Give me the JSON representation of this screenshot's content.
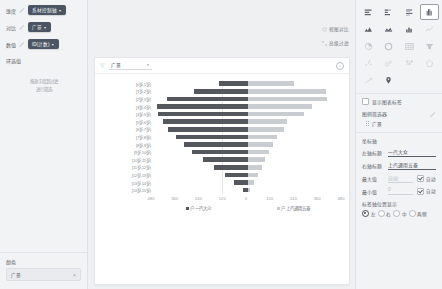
{
  "left_panel": {
    "fields": [
      {
        "label": "维度",
        "icon": "pencil-icon",
        "value": "系材控制轴",
        "caret": "▾"
      },
      {
        "label": "对比",
        "icon": "pencil-icon",
        "value": "广景",
        "caret": "▾"
      },
      {
        "label": "数值",
        "icon": "pencil-icon",
        "value": "ID(计数)",
        "caret": "▾"
      }
    ],
    "section_title": "环选值",
    "hint_line1": "拖放字段到过滤",
    "hint_line2": "进行筛选",
    "bottom": {
      "title": "颜色",
      "value": "广景",
      "clear_icon": "close-icon"
    }
  },
  "center": {
    "links": [
      {
        "icon": "refresh-icon",
        "label": "视图对比"
      },
      {
        "icon": "expand-icon",
        "label": "高级过滤"
      }
    ],
    "card": {
      "funnel_icon": "funnel-icon",
      "selector_value": "广景",
      "selector_caret": "▾",
      "info_icon": "info-icon"
    },
    "chart_data": {
      "type": "bar",
      "subtype": "butterfly",
      "title": "",
      "categories": [
        "[0岁,1岁)",
        "[1岁,2岁)",
        "[2岁,3岁)",
        "[3岁,4岁)",
        "[4岁,5岁)",
        "[5岁,6岁)",
        "[6岁,7岁)",
        "[7岁,8岁)",
        "[8岁,9岁)",
        "[9岁,10岁)",
        "[10岁,11岁)",
        "[11岁,12岁)",
        "[12岁,13岁)",
        "[13岁,14岁)",
        "[14岁,15岁)"
      ],
      "series": [
        {
          "name": "一汽大众",
          "side": "left",
          "color": "#54585e",
          "values": [
            150,
            280,
            420,
            470,
            465,
            440,
            415,
            370,
            330,
            290,
            230,
            175,
            120,
            70,
            28
          ]
        },
        {
          "name": "上汽通用五菱",
          "side": "right",
          "color": "#c9ccd0",
          "values": [
            235,
            400,
            410,
            330,
            290,
            200,
            185,
            150,
            130,
            110,
            90,
            70,
            50,
            30,
            12
          ]
        }
      ],
      "xticks_left": [
        480,
        360,
        240,
        120
      ],
      "xticks_center": [
        0
      ],
      "xticks_right": [
        120,
        240,
        360,
        480
      ],
      "xlim": [
        0,
        480
      ],
      "xlabel_left": "户 一汽大众",
      "xlabel_right": "户 上汽通用五菱",
      "ylabel": "",
      "grid": false,
      "legend": "bottom"
    }
  },
  "right_panel": {
    "chart_types": [
      {
        "name": "bar-horizontal-icon",
        "selected": false,
        "state": "active"
      },
      {
        "name": "bar-stacked-icon",
        "selected": false,
        "state": "active"
      },
      {
        "name": "bar-grouped-icon",
        "selected": false,
        "state": "active"
      },
      {
        "name": "butterfly-chart-icon",
        "selected": true,
        "state": "active"
      },
      {
        "name": "area-chart-icon",
        "selected": false,
        "state": "active"
      },
      {
        "name": "area-stacked-icon",
        "selected": false,
        "state": "active"
      },
      {
        "name": "column-chart-icon",
        "selected": false,
        "state": "active"
      },
      {
        "name": "line-chart-icon",
        "selected": false,
        "state": "dim"
      },
      {
        "name": "pie-chart-icon",
        "selected": false,
        "state": "dim"
      },
      {
        "name": "donut-chart-icon",
        "selected": false,
        "state": "dim"
      },
      {
        "name": "table-icon",
        "selected": false,
        "state": "dim"
      },
      {
        "name": "funnel-chart-icon",
        "selected": false,
        "state": "dim"
      },
      {
        "name": "scatter-plot-icon",
        "selected": false,
        "state": "dim2"
      },
      {
        "name": "bubble-chart-icon",
        "selected": false,
        "state": "dim2"
      },
      {
        "name": "heatmap-icon",
        "selected": false,
        "state": "dim2"
      },
      {
        "name": "radar-chart-icon",
        "selected": false,
        "state": "dim2"
      },
      {
        "name": "trend-line-icon",
        "selected": false,
        "state": "dim2"
      },
      {
        "name": "map-chart-icon",
        "selected": false,
        "state": "active"
      }
    ],
    "show_label_checkbox": {
      "label": "显示图表标签",
      "checked": false
    },
    "section": {
      "title": "图例筛选器",
      "edit_icon": "pencil-icon"
    },
    "tag": {
      "label": "广景",
      "handle": "drag-handle-icon"
    },
    "axis_group_title": "坐标轴",
    "rows": [
      {
        "label": "左轴标题",
        "value": "一汽大众",
        "underline": true,
        "auto_label": "",
        "auto_checked": false,
        "has_auto": false
      },
      {
        "label": "右轴标题",
        "value": "上汽通用五菱",
        "underline": true,
        "auto_label": "",
        "auto_checked": false,
        "has_auto": false
      },
      {
        "label": "最大值",
        "value": "自动",
        "underline": false,
        "auto_label": "自动",
        "auto_checked": true,
        "has_auto": true
      },
      {
        "label": "最小值",
        "value": "0",
        "underline": false,
        "auto_label": "自动",
        "auto_checked": true,
        "has_auto": true
      }
    ],
    "radio_group": {
      "title": "标签轴位置显示",
      "options": [
        {
          "label": "左",
          "selected": true
        },
        {
          "label": "右",
          "selected": false
        },
        {
          "label": "中",
          "selected": false
        },
        {
          "label": "两侧",
          "selected": false
        }
      ]
    }
  }
}
